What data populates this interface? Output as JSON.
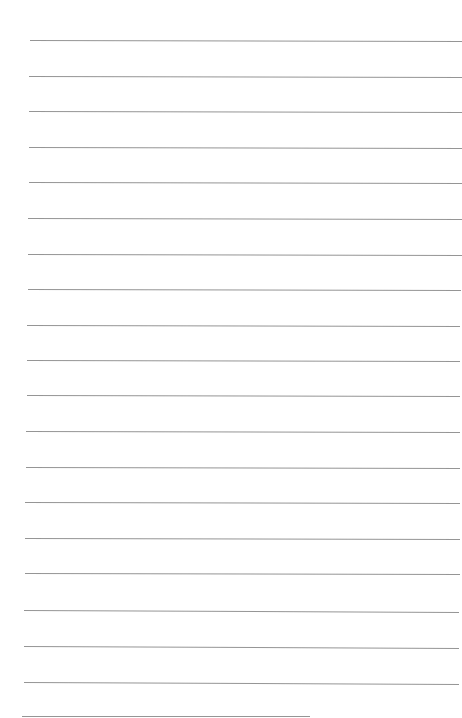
{
  "page": {
    "type": "lined-paper",
    "background": "#ffffff",
    "line_color": "#8a8a8a",
    "lines": [
      {
        "y": 40,
        "x1": 30,
        "x2": 462,
        "tilt": 1
      },
      {
        "y": 76,
        "x1": 29,
        "x2": 462,
        "tilt": 1
      },
      {
        "y": 111,
        "x1": 29,
        "x2": 462,
        "tilt": 1
      },
      {
        "y": 147,
        "x1": 29,
        "x2": 462,
        "tilt": 1
      },
      {
        "y": 182,
        "x1": 29,
        "x2": 462,
        "tilt": 1
      },
      {
        "y": 218,
        "x1": 28,
        "x2": 462,
        "tilt": 1
      },
      {
        "y": 254,
        "x1": 28,
        "x2": 462,
        "tilt": 1
      },
      {
        "y": 289,
        "x1": 28,
        "x2": 461,
        "tilt": 1
      },
      {
        "y": 325,
        "x1": 27,
        "x2": 460,
        "tilt": 1
      },
      {
        "y": 360,
        "x1": 27,
        "x2": 460,
        "tilt": 1
      },
      {
        "y": 395,
        "x1": 27,
        "x2": 460,
        "tilt": 1
      },
      {
        "y": 431,
        "x1": 26,
        "x2": 460,
        "tilt": 1
      },
      {
        "y": 467,
        "x1": 26,
        "x2": 460,
        "tilt": 1
      },
      {
        "y": 502,
        "x1": 25,
        "x2": 460,
        "tilt": 1
      },
      {
        "y": 538,
        "x1": 25,
        "x2": 460,
        "tilt": 1
      },
      {
        "y": 573,
        "x1": 25,
        "x2": 460,
        "tilt": 1
      },
      {
        "y": 610,
        "x1": 24,
        "x2": 459,
        "tilt": 2
      },
      {
        "y": 646,
        "x1": 24,
        "x2": 459,
        "tilt": 2
      },
      {
        "y": 682,
        "x1": 24,
        "x2": 459,
        "tilt": 2
      },
      {
        "y": 716,
        "x1": 22,
        "x2": 310,
        "tilt": 0
      }
    ]
  }
}
